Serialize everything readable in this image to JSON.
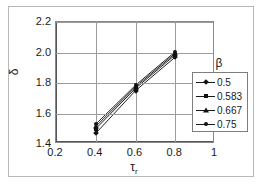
{
  "chart_data": {
    "type": "line",
    "title": "",
    "xlabel": "τr",
    "ylabel": "δ",
    "x": [
      0.4,
      0.6,
      0.8
    ],
    "xlim": [
      0.2,
      1.0
    ],
    "ylim": [
      1.4,
      2.2
    ],
    "xticks": [
      "0.2",
      "0.4",
      "0.6",
      "0.8",
      "1"
    ],
    "yticks": [
      "1.4",
      "1.6",
      "1.8",
      "2.0",
      "2.2"
    ],
    "grid": true,
    "legend_position": "right",
    "legend_title": "β",
    "series": [
      {
        "name": "0.5",
        "marker": "diamond",
        "values": [
          1.47,
          1.75,
          1.97
        ]
      },
      {
        "name": "0.583",
        "marker": "square",
        "values": [
          1.5,
          1.765,
          1.985
        ]
      },
      {
        "name": "0.667",
        "marker": "triangle",
        "values": [
          1.515,
          1.775,
          1.995
        ]
      },
      {
        "name": "0.75",
        "marker": "circle",
        "values": [
          1.53,
          1.785,
          2.005
        ]
      }
    ]
  },
  "axes": {
    "y_title": "δ",
    "x_title_base": "τ",
    "x_title_sub": "r"
  }
}
